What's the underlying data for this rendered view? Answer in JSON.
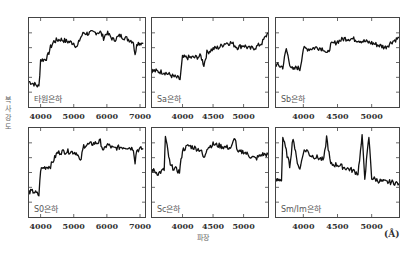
{
  "axes": {
    "ylabel": "복사강도",
    "xlabel": "파장",
    "unit": "(Å)"
  },
  "chart_data": [
    {
      "type": "line",
      "panel": "타원은하",
      "label": "타원은하",
      "xticks": [
        4000,
        5000,
        6000,
        7000
      ],
      "xlim": [
        3650,
        7150
      ],
      "x": [
        3650,
        3800,
        3950,
        4000,
        4100,
        4200,
        4300,
        4400,
        4500,
        4600,
        4800,
        5000,
        5100,
        5200,
        5300,
        5400,
        5600,
        5800,
        5900,
        6000,
        6200,
        6400,
        6600,
        6800,
        6850,
        6900,
        7100
      ],
      "y": [
        0.25,
        0.22,
        0.18,
        0.55,
        0.55,
        0.58,
        0.72,
        0.8,
        0.82,
        0.83,
        0.8,
        0.78,
        0.72,
        0.85,
        0.92,
        0.91,
        0.92,
        0.93,
        0.85,
        0.92,
        0.82,
        0.88,
        0.84,
        0.8,
        0.6,
        0.78,
        0.78
      ]
    },
    {
      "type": "line",
      "panel": "Sa은하",
      "label": "Sa은하",
      "xticks": [
        4000,
        4500,
        5000
      ],
      "xlim": [
        3500,
        5400
      ],
      "x": [
        3500,
        3700,
        3850,
        3920,
        3960,
        4000,
        4100,
        4200,
        4300,
        4350,
        4400,
        4500,
        4600,
        4700,
        4800,
        4900,
        5000,
        5100,
        5200,
        5300,
        5400
      ],
      "y": [
        0.4,
        0.38,
        0.32,
        0.3,
        0.28,
        0.58,
        0.58,
        0.58,
        0.6,
        0.48,
        0.65,
        0.7,
        0.72,
        0.78,
        0.78,
        0.72,
        0.75,
        0.7,
        0.72,
        0.78,
        0.92
      ]
    },
    {
      "type": "line",
      "panel": "Sb은하",
      "label": "Sb은하",
      "xticks": [
        4000,
        4500,
        5000
      ],
      "xlim": [
        3600,
        5400
      ],
      "x": [
        3600,
        3700,
        3750,
        3800,
        3850,
        3900,
        3950,
        4000,
        4100,
        4200,
        4300,
        4350,
        4400,
        4500,
        4600,
        4700,
        4800,
        4900,
        5000,
        5100,
        5200,
        5300,
        5400
      ],
      "y": [
        0.48,
        0.45,
        0.7,
        0.5,
        0.4,
        0.45,
        0.42,
        0.7,
        0.7,
        0.72,
        0.7,
        0.62,
        0.75,
        0.8,
        0.84,
        0.84,
        0.82,
        0.8,
        0.78,
        0.75,
        0.72,
        0.8,
        0.85
      ]
    },
    {
      "type": "line",
      "panel": "S0은하",
      "label": "S0은하",
      "xticks": [
        4000,
        5000,
        6000,
        7000
      ],
      "xlim": [
        3650,
        7150
      ],
      "x": [
        3650,
        3800,
        3950,
        4000,
        4100,
        4300,
        4500,
        4700,
        4900,
        5100,
        5200,
        5300,
        5500,
        5700,
        5800,
        5900,
        6000,
        6200,
        6400,
        6600,
        6800,
        6850,
        6900,
        7100
      ],
      "y": [
        0.25,
        0.25,
        0.2,
        0.55,
        0.58,
        0.6,
        0.78,
        0.8,
        0.8,
        0.78,
        0.65,
        0.88,
        0.9,
        0.92,
        0.94,
        0.8,
        0.9,
        0.84,
        0.86,
        0.86,
        0.84,
        0.66,
        0.82,
        0.84
      ]
    },
    {
      "type": "line",
      "panel": "Sc은하",
      "label": "Sc은하",
      "xticks": [
        4000,
        4500,
        5000
      ],
      "xlim": [
        3500,
        5400
      ],
      "x": [
        3500,
        3600,
        3700,
        3720,
        3800,
        3900,
        3950,
        4000,
        4100,
        4200,
        4300,
        4350,
        4400,
        4500,
        4600,
        4700,
        4800,
        4860,
        4900,
        5000,
        5100,
        5200,
        5300,
        5400
      ],
      "y": [
        0.55,
        0.5,
        0.55,
        1.0,
        0.6,
        0.55,
        0.52,
        0.82,
        0.88,
        0.85,
        0.82,
        0.7,
        0.85,
        0.9,
        0.88,
        0.86,
        0.85,
        1.0,
        0.78,
        0.8,
        0.74,
        0.7,
        0.76,
        0.76
      ]
    },
    {
      "type": "line",
      "panel": "Sm/Im은하",
      "label": "Sm/Im은하",
      "xticks": [
        4000,
        4500,
        5000
      ],
      "xlim": [
        3600,
        5400
      ],
      "x": [
        3600,
        3680,
        3700,
        3800,
        3850,
        3900,
        3950,
        4000,
        4050,
        4100,
        4200,
        4300,
        4340,
        4400,
        4500,
        4600,
        4700,
        4800,
        4860,
        4900,
        4960,
        5000,
        5100,
        5200,
        5300,
        5400
      ],
      "y": [
        0.4,
        0.42,
        1.0,
        0.6,
        1.0,
        0.7,
        0.55,
        0.8,
        0.82,
        0.75,
        0.72,
        0.68,
        1.0,
        0.62,
        0.62,
        0.58,
        0.55,
        0.5,
        1.0,
        0.45,
        1.0,
        0.44,
        0.4,
        0.38,
        0.38,
        0.36
      ]
    }
  ]
}
